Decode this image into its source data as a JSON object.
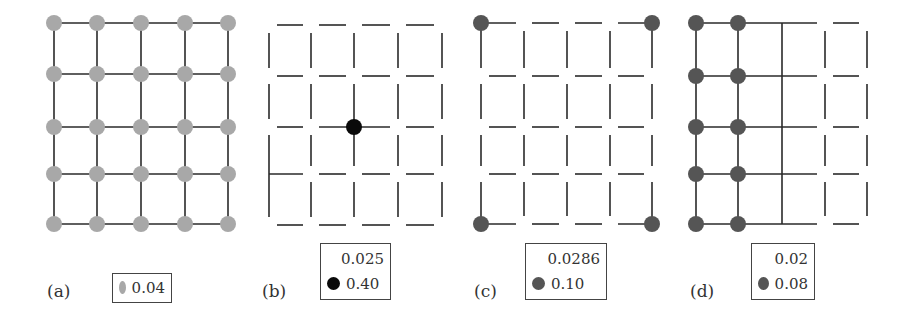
{
  "figure": {
    "grid_size": 5,
    "colors": {
      "line": "#2a2a2a",
      "light_gray_node": "#a8a8a8",
      "black_node": "#0a0a0a",
      "dark_gray_node": "#555555",
      "white_node": "#ffffff"
    },
    "panels": [
      {
        "id": "a",
        "label": "(a)",
        "xs": [
          54,
          97,
          141,
          185,
          228
        ],
        "ys": [
          23,
          74,
          127,
          174,
          224
        ],
        "legend": [
          {
            "color": "#a8a8a8",
            "value": "0.04"
          }
        ]
      },
      {
        "id": "b",
        "label": "(b)",
        "xs": [
          269,
          311,
          354,
          398,
          442
        ],
        "ys": [
          25,
          76,
          127,
          174,
          225
        ],
        "legend": [
          {
            "color": "#ffffff",
            "value": "0.025"
          },
          {
            "color": "#0a0a0a",
            "value": "0.40"
          }
        ]
      },
      {
        "id": "c",
        "label": "(c)",
        "xs": [
          481,
          524,
          567,
          610,
          652
        ],
        "ys": [
          23,
          76,
          127,
          174,
          224
        ],
        "legend": [
          {
            "color": "#ffffff",
            "value": "0.0286"
          },
          {
            "color": "#555555",
            "value": "0.10"
          }
        ]
      },
      {
        "id": "d",
        "label": "(d)",
        "xs": [
          696,
          738,
          782,
          825,
          867
        ],
        "ys": [
          23,
          76,
          127,
          174,
          224
        ],
        "legend": [
          {
            "color": "#ffffff",
            "value": "0.02"
          },
          {
            "color": "#555555",
            "value": "0.08"
          }
        ]
      }
    ]
  }
}
